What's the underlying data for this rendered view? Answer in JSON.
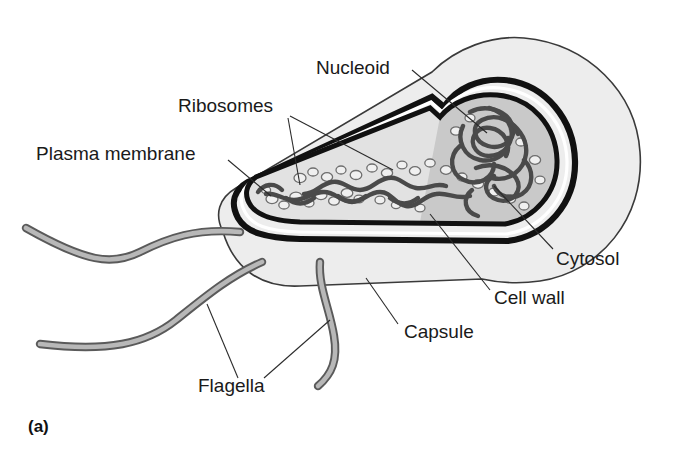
{
  "figure": {
    "panel_label": "(a)"
  },
  "labels": {
    "nucleoid": "Nucleoid",
    "ribosomes": "Ribosomes",
    "plasma_membrane": "Plasma membrane",
    "cytosol": "Cytosol",
    "cell_wall": "Cell wall",
    "capsule": "Capsule",
    "flagella": "Flagella"
  },
  "colors": {
    "background": "#ffffff",
    "ink": "#1a1a1a",
    "envelope_dark": "#111111",
    "capsule_fill": "#ededed",
    "capsule_stroke": "#3a3a3a",
    "cytosol_fill": "#e2e2e2",
    "nucleoid_zone_fill": "#c9c9c9",
    "nucleoid_strand": "#4a4a4a",
    "ribosome_fill": "#f0f0f0",
    "ribosome_stroke": "#6e6e6e",
    "flagellum_fill": "#b3b3b3",
    "flagellum_stroke": "#5a5a5a",
    "leader_line": "#2b2b2b"
  },
  "structures": [
    {
      "name": "capsule",
      "description": "outermost light gray layer surrounding the rod-shaped cell"
    },
    {
      "name": "cell-wall",
      "description": "thick dark outer line of the cell envelope"
    },
    {
      "name": "plasma-membrane",
      "description": "thick dark inner line of the cell envelope"
    },
    {
      "name": "cytosol",
      "description": "gray interior fluid of the cell"
    },
    {
      "name": "nucleoid",
      "description": "tangled DNA filament mass in the cell interior"
    },
    {
      "name": "ribosomes",
      "description": "small pale granules scattered through the cytosol"
    },
    {
      "name": "flagella",
      "description": "three long gray whip-like appendages at the left pole"
    }
  ],
  "label_positions": {
    "nucleoid": {
      "x": 316,
      "y": 74
    },
    "ribosomes": {
      "x": 178,
      "y": 112
    },
    "plasma_membrane": {
      "x": 36,
      "y": 160
    },
    "cytosol": {
      "x": 556,
      "y": 265
    },
    "cell_wall": {
      "x": 494,
      "y": 304
    },
    "capsule": {
      "x": 404,
      "y": 338
    },
    "flagella": {
      "x": 198,
      "y": 392
    },
    "panel_label": {
      "x": 28,
      "y": 432
    }
  }
}
